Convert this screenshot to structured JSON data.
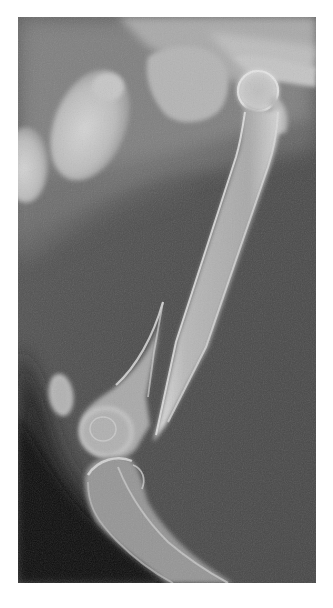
{
  "image": {
    "kind": "radiograph",
    "view": "lateral hind limb",
    "description": "Lateral radiograph showing an oblique mid-shaft femoral fracture with overriding fragments, pelvis and femoral head at top, stifle joint and tibia below",
    "structures": [
      {
        "id": "femoral-head",
        "label": "Femoral head in acetabulum"
      },
      {
        "id": "proximal-femur-fragment",
        "label": "Proximal femoral shaft fragment (pointed distal tip)"
      },
      {
        "id": "distal-femur-fragment",
        "label": "Distal femoral fragment with condyles (pointed proximal spike)"
      },
      {
        "id": "patella",
        "label": "Patella"
      },
      {
        "id": "tibia",
        "label": "Proximal tibia"
      },
      {
        "id": "pelvis",
        "label": "Pelvis / ilium"
      },
      {
        "id": "fecal-material",
        "label": "Fecal material in colon"
      },
      {
        "id": "soft-tissue",
        "label": "Abdominal / thigh soft tissue"
      }
    ]
  },
  "colors": {
    "page_background": "#ffffff",
    "film_mid_gray": "#4d4d4d",
    "film_dark": "#0a0a0a",
    "soft_tissue": "#8a8a8a",
    "bone": "#c9c9c9",
    "bone_bright": "#e4e4e4",
    "bone_cortex": "#d8d8d8"
  }
}
